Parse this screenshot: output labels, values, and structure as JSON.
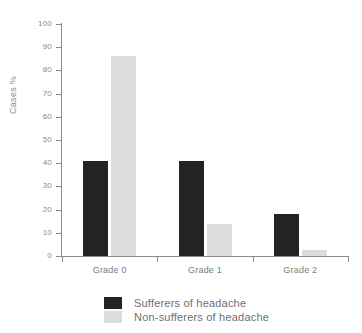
{
  "chart_data": {
    "type": "bar",
    "title": "",
    "xlabel": "",
    "ylabel": "Cases %",
    "ylim": [
      0,
      100
    ],
    "ytick_step": 10,
    "yticks": [
      100,
      90,
      80,
      70,
      60,
      50,
      40,
      30,
      20,
      10,
      0
    ],
    "grid": false,
    "legend_position": "bottom",
    "categories": [
      "Grade 0",
      "Grade 1",
      "Grade 2"
    ],
    "series": [
      {
        "name": "Sufferers of headache",
        "color": "#232323",
        "values": [
          41,
          41,
          18
        ]
      },
      {
        "name": "Non-sufferers of headache",
        "color": "#dcdcdc",
        "values": [
          86,
          14,
          2.5
        ]
      }
    ]
  },
  "axis": {
    "line_color": "#8c8c8c",
    "tick_label_color": "#8a8a8a",
    "category_label_color": "#7d7d7d"
  }
}
